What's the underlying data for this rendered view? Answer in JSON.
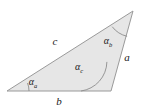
{
  "figure": {
    "type": "geometry-diagram",
    "shape": "triangle",
    "background_color": "#ffffff",
    "fill_color": "#e6e6e6",
    "stroke_color": "#9a9a9a",
    "label_color": "#1a1a1a"
  },
  "vertices": {
    "left": {
      "x": 7,
      "y": 91
    },
    "top": {
      "x": 133,
      "y": 11
    },
    "bottom_right": {
      "x": 111,
      "y": 91
    }
  },
  "sides": [
    {
      "id": "side-c",
      "label": "c",
      "position": {
        "x": 55,
        "y": 45
      },
      "between": [
        "left",
        "top"
      ]
    },
    {
      "id": "side-a",
      "label": "a",
      "position": {
        "x": 127,
        "y": 61
      },
      "between": [
        "top",
        "bottom_right"
      ]
    },
    {
      "id": "side-b",
      "label": "b",
      "position": {
        "x": 59,
        "y": 105
      },
      "between": [
        "left",
        "bottom_right"
      ]
    }
  ],
  "angles": [
    {
      "id": "angle-alpha-a",
      "symbol": "α",
      "subscript": "a",
      "vertex": "left",
      "label_position": {
        "x": 33,
        "y": 85
      },
      "arc_radius": 22
    },
    {
      "id": "angle-alpha-b",
      "symbol": "α",
      "subscript": "b",
      "vertex": "top",
      "label_position": {
        "x": 108,
        "y": 44
      },
      "arc_radius": 26
    },
    {
      "id": "angle-alpha-c",
      "symbol": "α",
      "subscript": "c",
      "vertex": "bottom_right",
      "label_position": {
        "x": 79,
        "y": 70
      },
      "arc_radius": 30
    }
  ]
}
